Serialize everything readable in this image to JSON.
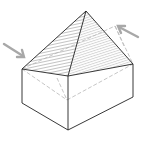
{
  "diagram": {
    "colors": {
      "outline": "#222222",
      "hatch": "#9a9a9a",
      "hidden_line": "#b8b8b8",
      "arrow": "#a8a8a8",
      "background": "#ffffff"
    },
    "points": {
      "apex": [
        86,
        11
      ],
      "roof_left": [
        22,
        69
      ],
      "roof_front": [
        68,
        76
      ],
      "roof_right": [
        133,
        64
      ],
      "roof_back": [
        115,
        26
      ],
      "base_left": [
        22,
        103
      ],
      "base_front": [
        68,
        130
      ],
      "base_right": [
        133,
        97
      ],
      "base_back_hidden": [
        67,
        100
      ]
    },
    "arrows": [
      {
        "name": "left-arrow",
        "from": [
          4,
          44
        ],
        "to": [
          24,
          57
        ]
      },
      {
        "name": "right-arrow",
        "from": [
          138,
          37
        ],
        "to": [
          118,
          26
        ]
      }
    ]
  }
}
